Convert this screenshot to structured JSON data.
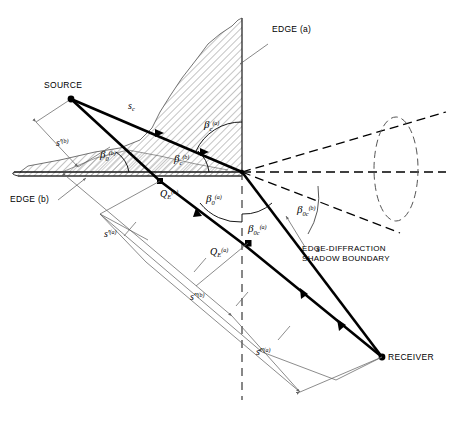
{
  "figure": {
    "domain": "technical-line-diagram",
    "background_color": "#ffffff",
    "ink_color": "#000000",
    "hatch_color": "#555555",
    "thin_line_color": "#6a6a6a"
  },
  "points": {
    "source": {
      "label": "SOURCE",
      "x": 71,
      "y": 99
    },
    "receiver": {
      "label": "RECEIVER",
      "x": 382,
      "y": 357
    },
    "apex": {
      "x": 242,
      "y": 172
    },
    "qe_b": {
      "x": 160,
      "y": 181
    },
    "qe_a": {
      "x": 248,
      "y": 243
    },
    "ray_mid_sc": {
      "x": 165,
      "y": 131
    },
    "ray_mid_s": {
      "x": 347,
      "y": 327
    }
  },
  "labels": {
    "source": "SOURCE",
    "receiver": "RECEIVER",
    "edge_a": "EDGE (a)",
    "edge_b": "EDGE (b)",
    "shadow_boundary_line1": "EDGE-DIFFRACTION",
    "shadow_boundary_line2": "SHADOW BOUNDARY"
  },
  "symbols": {
    "s_c": {
      "base": "s",
      "sub": "c",
      "sup": "",
      "prime": "",
      "text": "s_c"
    },
    "s": {
      "base": "s",
      "sub": "",
      "sup": "",
      "prime": "",
      "text": "s"
    },
    "s_prime_b": {
      "base": "s",
      "sub": "",
      "sup": "(b)",
      "prime": "'",
      "text": "s'(b)"
    },
    "s_prime_a": {
      "base": "s",
      "sub": "",
      "sup": "(a)",
      "prime": "'",
      "text": "s'(a)"
    },
    "s_dprime_b": {
      "base": "s",
      "sub": "",
      "sup": "(b)",
      "prime": "\"",
      "text": "s\"(b)"
    },
    "s_dprime_a": {
      "base": "s",
      "sub": "",
      "sup": "(a)",
      "prime": "\"",
      "text": "s\"(a)"
    },
    "qe_b": {
      "base": "Q",
      "sub": "E",
      "sup": "(b)",
      "prime": "",
      "text": "Q_E(b)"
    },
    "qe_a": {
      "base": "Q",
      "sub": "E",
      "sup": "(a)",
      "prime": "",
      "text": "Q_E(a)"
    }
  },
  "angles": {
    "beta_0_b": {
      "base": "β",
      "sub": "0",
      "sup": "(b)"
    },
    "beta_c_b": {
      "base": "β",
      "sub": "c",
      "sup": "(b)"
    },
    "beta_c_a": {
      "base": "β",
      "sub": "c",
      "sup": "(a)"
    },
    "beta_0_a": {
      "base": "β",
      "sub": "0",
      "sup": "(a)"
    },
    "beta_0c_a": {
      "base": "β",
      "sub": "0c",
      "sup": "(a)"
    },
    "beta_0c_b": {
      "base": "β",
      "sub": "0c",
      "sup": "(b)"
    }
  },
  "elements": {
    "wedge_face_a": "vertical hatched wedge face rising from apex",
    "ground_plane_b": "horizontal hatched thin plate forming edge b",
    "cone_ellipse": "dashed diffraction cone with elliptical cross-section",
    "shadow_boundary_ray": "dashed straight line marking edge-diffraction shadow boundary"
  }
}
